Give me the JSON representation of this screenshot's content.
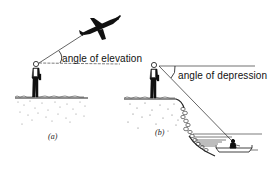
{
  "diagram": {
    "panel_a": {
      "label": "angle of elevation",
      "caption": "(a)",
      "elements": [
        "observer",
        "aeroplane",
        "line-of-sight",
        "horizontal",
        "ground"
      ]
    },
    "panel_b": {
      "label": "angle of depression",
      "caption": "(b)",
      "elements": [
        "observer-on-cliff",
        "cliff",
        "sea",
        "boat",
        "line-of-sight",
        "horizontal"
      ]
    },
    "colors": {
      "ink": "#111111",
      "background": "#ffffff"
    }
  }
}
